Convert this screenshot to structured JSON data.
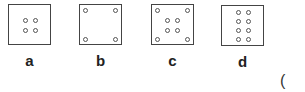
{
  "figures": [
    {
      "label": "a",
      "dots": 4,
      "arrangement": "2x2 center"
    },
    {
      "label": "b",
      "dots": 4,
      "arrangement": "corners"
    },
    {
      "label": "c",
      "dots": 8,
      "arrangement": "corners + 2x2 center"
    },
    {
      "label": "d",
      "dots": 8,
      "arrangement": "2x4 center column"
    }
  ],
  "answer_paren": "("
}
